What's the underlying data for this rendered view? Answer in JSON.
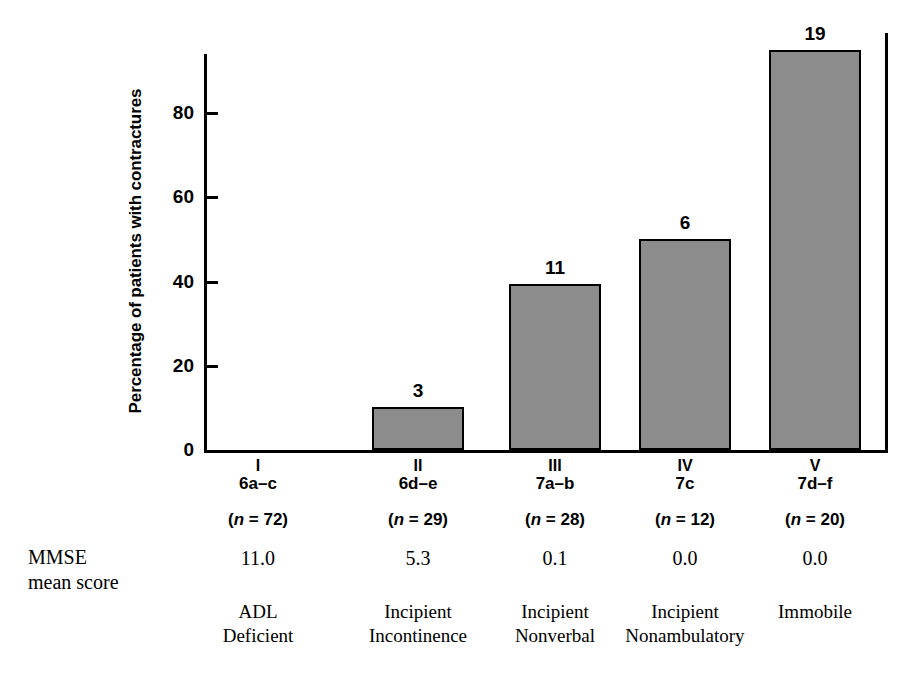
{
  "chart_data": {
    "type": "bar",
    "title": "",
    "xlabel": "",
    "ylabel": "Percentage of patients with contractures",
    "ylim": [
      0,
      95
    ],
    "yticks": [
      "0",
      "20",
      "40",
      "60",
      "80"
    ],
    "ytick_values": [
      0,
      20,
      40,
      60,
      80
    ],
    "grid": false,
    "legend": "none",
    "categories": [
      "I",
      "II",
      "III",
      "IV",
      "V"
    ],
    "values": [
      0,
      10.3,
      39.3,
      50.0,
      95.0
    ],
    "bar_labels": [
      "",
      "3",
      "11",
      "6",
      "19"
    ],
    "bar_fill_color": "#8c8c8c",
    "bar_edge_color": "#000000",
    "annotations": {
      "bar_labels_meaning": "number of patients with contractures",
      "row_label": "MMSE mean score"
    },
    "series": [
      {
        "name": "Percentage of patients with contractures",
        "values": [
          0,
          10.3,
          39.3,
          50.0,
          95.0
        ]
      }
    ],
    "table": {
      "row_headers": [
        "stage",
        "n",
        "MMSE mean score",
        "description"
      ],
      "columns": [
        {
          "roman": "I",
          "stage": "6a–c",
          "n_label": "(n = 72)",
          "n_value": 72,
          "mmse": "11.0",
          "desc_line1": "ADL",
          "desc_line2": "Deficient",
          "count_with_contractures": null,
          "percentage": 0
        },
        {
          "roman": "II",
          "stage": "6d–e",
          "n_label": "(n = 29)",
          "n_value": 29,
          "mmse": "5.3",
          "desc_line1": "Incipient",
          "desc_line2": "Incontinence",
          "count_with_contractures": "3",
          "percentage": 10.3
        },
        {
          "roman": "III",
          "stage": "7a–b",
          "n_label": "(n = 28)",
          "n_value": 28,
          "mmse": "0.1",
          "desc_line1": "Incipient",
          "desc_line2": "Nonverbal",
          "count_with_contractures": "11",
          "percentage": 39.3
        },
        {
          "roman": "IV",
          "stage": "7c",
          "n_label": "(n = 12)",
          "n_value": 12,
          "mmse": "0.0",
          "desc_line1": "Incipient",
          "desc_line2": "Nonambulatory",
          "count_with_contractures": "6",
          "percentage": 50.0
        },
        {
          "roman": "V",
          "stage": "7d–f",
          "n_label": "(n = 20)",
          "n_value": 20,
          "mmse": "0.0",
          "desc_line1": "Immobile",
          "desc_line2": "",
          "count_with_contractures": "19",
          "percentage": 95.0
        }
      ]
    }
  },
  "row_label": {
    "line1": "MMSE",
    "line2": "mean score"
  }
}
